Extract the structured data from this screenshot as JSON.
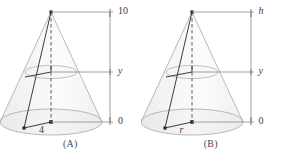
{
  "document": {
    "kind": "geometry-diagram-pair",
    "subject": "cone-cross-section"
  },
  "palette": {
    "outline": "#9a9a9a",
    "body_fill": "#f2f2f2",
    "body_fill_light": "#f8f8f8",
    "solid_line": "#3c3c3c",
    "axis_line": "#8c8c8c",
    "text": "#3c3c3c",
    "caption": "#4a4a4a"
  },
  "figures": [
    {
      "id": "A",
      "caption": "(A)",
      "scale": {
        "top_label": "10",
        "mid_label": "y",
        "bottom_label": "0",
        "top_value": 10,
        "mid_value": "y",
        "bottom_value": 0
      },
      "radius_label": "4",
      "radius_value": 4,
      "apex_label": "",
      "notes": "Cone of height 10 and base radius 4 with horizontal cross-section at height y"
    },
    {
      "id": "B",
      "caption": "(B)",
      "scale": {
        "top_label": "h",
        "mid_label": "y",
        "bottom_label": "0",
        "top_value": "h",
        "mid_value": "y",
        "bottom_value": 0
      },
      "radius_label": "r",
      "radius_value": "r",
      "apex_label": "",
      "notes": "General cone of height h and base radius r with horizontal cross-section at height y"
    }
  ]
}
